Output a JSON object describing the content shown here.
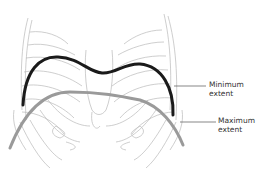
{
  "figure": {
    "labels": {
      "minimum": {
        "line1": "Minimum",
        "line2": "extent"
      },
      "maximum": {
        "line1": "Maximum",
        "line2": "extent"
      }
    },
    "colors": {
      "minimum_curve": "#1a1a1a",
      "maximum_curve": "#9a9a9a",
      "ribs": "#b9b9b9",
      "leader_lines": "#555555",
      "background": "#ffffff"
    }
  }
}
